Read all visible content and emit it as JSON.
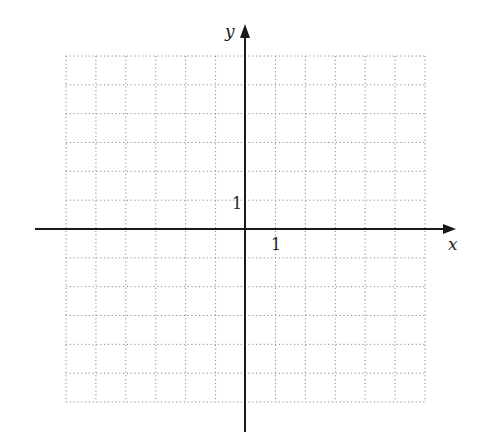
{
  "figure": {
    "type": "coordinate-grid",
    "x_axis_label": "x",
    "y_axis_label": "y",
    "x_tick_label": "1",
    "y_tick_label": "1",
    "grid": {
      "columns": 12,
      "rows": 12,
      "x_range": [
        -6,
        6
      ],
      "y_range": [
        -6,
        6
      ],
      "style": "dotted"
    },
    "colors": {
      "axis": "#1a1a1a",
      "grid": "#8a8a8a",
      "background": "#ffffff"
    }
  }
}
